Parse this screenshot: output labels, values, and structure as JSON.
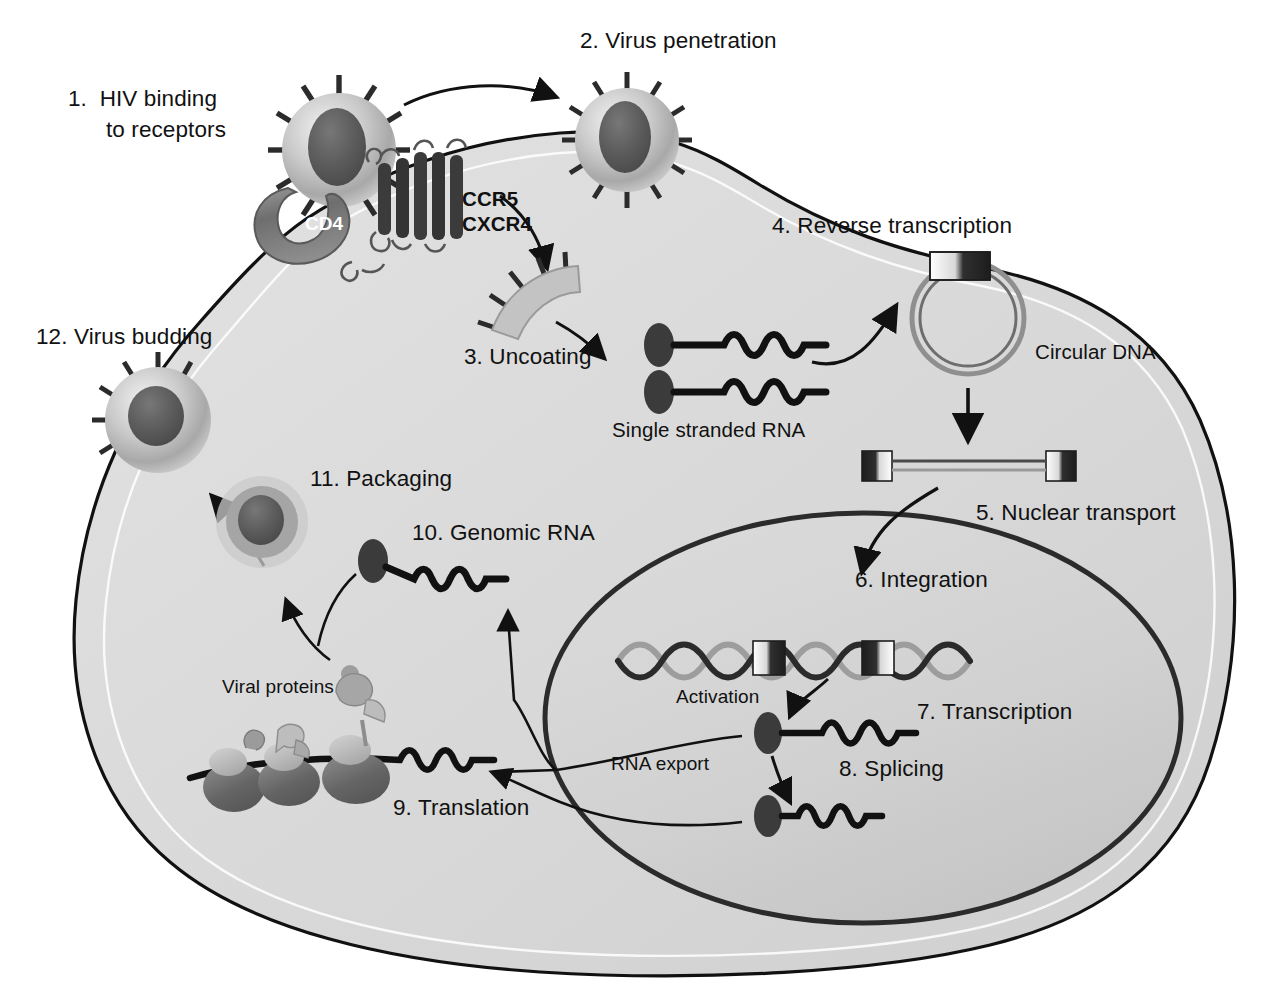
{
  "figure": {
    "type": "biological-process-diagram",
    "background_color": "#ffffff",
    "cytoplasm_color": "#d8d8d8",
    "nucleus_color": "#d0d0d0",
    "outline_color": "#111111",
    "accent_dark": "#3a3a3a",
    "accent_mid": "#8c8c8c",
    "accent_light": "#c6c6c6"
  },
  "steps": [
    {
      "id": 1,
      "label": "1.  HIV binding",
      "label2": "to receptors",
      "x": 68,
      "y": 86
    },
    {
      "id": 2,
      "label": "2. Virus penetration",
      "x": 580,
      "y": 28
    },
    {
      "id": 3,
      "label": "3. Uncoating",
      "x": 464,
      "y": 344
    },
    {
      "id": 4,
      "label": "4. Reverse transcription",
      "x": 772,
      "y": 213
    },
    {
      "id": 5,
      "label": "5. Nuclear transport",
      "x": 976,
      "y": 500
    },
    {
      "id": 6,
      "label": "6. Integration",
      "x": 855,
      "y": 567
    },
    {
      "id": 7,
      "label": "7. Transcription",
      "x": 917,
      "y": 699
    },
    {
      "id": 8,
      "label": "8. Splicing",
      "x": 839,
      "y": 756
    },
    {
      "id": 9,
      "label": "9. Translation",
      "x": 393,
      "y": 795
    },
    {
      "id": 10,
      "label": "10. Genomic RNA",
      "x": 412,
      "y": 520
    },
    {
      "id": 11,
      "label": "11. Packaging",
      "x": 310,
      "y": 466
    },
    {
      "id": 12,
      "label": "12. Virus budding",
      "x": 36,
      "y": 324
    }
  ],
  "annotations": [
    {
      "name": "cd4-label",
      "text": "CD4",
      "x": 305,
      "y": 213
    },
    {
      "name": "ccr5-label",
      "text": "CCR5",
      "x": 462,
      "y": 187
    },
    {
      "name": "cxcr4-label",
      "text": "CXCR4",
      "x": 462,
      "y": 212
    },
    {
      "name": "single-stranded-rna-label",
      "text": "Single stranded RNA",
      "x": 612,
      "y": 418
    },
    {
      "name": "circular-dna-label",
      "text": "Circular DNA",
      "x": 1035,
      "y": 340
    },
    {
      "name": "activation-label",
      "text": "Activation",
      "x": 676,
      "y": 686
    },
    {
      "name": "rna-export-label",
      "text": "RNA export",
      "x": 611,
      "y": 753
    },
    {
      "name": "viral-proteins-label",
      "text": "Viral proteins",
      "x": 222,
      "y": 676
    }
  ],
  "entities": [
    {
      "name": "hiv-virion-binding",
      "kind": "virion",
      "note": "spiked HIV particle outside cell, step 1"
    },
    {
      "name": "hiv-virion-penetrating",
      "kind": "virion",
      "note": "spiked HIV particle entering membrane, step 2"
    },
    {
      "name": "hiv-virion-budding",
      "kind": "virion",
      "note": "spiked HIV particle budding out, step 12"
    },
    {
      "name": "cd4-receptor",
      "kind": "receptor",
      "note": "crescent shaped CD4 molecule"
    },
    {
      "name": "coreceptor-7tm",
      "kind": "receptor",
      "note": "seven transmembrane helix coreceptor CCR5/CXCR4"
    },
    {
      "name": "viral-capsid-opening",
      "kind": "capsid",
      "note": "partially opened spiked envelope fragment, step 3"
    },
    {
      "name": "ssrna-strand-upper",
      "kind": "rna",
      "note": "single stranded RNA with cap"
    },
    {
      "name": "ssrna-strand-lower",
      "kind": "rna",
      "note": "single stranded RNA with cap"
    },
    {
      "name": "circular-dna",
      "kind": "dna",
      "note": "circular viral DNA with LTR block"
    },
    {
      "name": "linear-dna",
      "kind": "dna",
      "note": "linear viral DNA flanked by two LTR blocks"
    },
    {
      "name": "host-chromosome",
      "kind": "dna",
      "note": "host double helix with two integrated proviral LTR blocks"
    },
    {
      "name": "mrna-transcript",
      "kind": "rna",
      "note": "unspliced mRNA, step 7"
    },
    {
      "name": "mrna-spliced",
      "kind": "rna",
      "note": "spliced mRNA, step 8"
    },
    {
      "name": "genomic-rna",
      "kind": "rna",
      "note": "genomic RNA in cytoplasm, step 10"
    },
    {
      "name": "polysome-ribosomes",
      "kind": "ribosome",
      "note": "three ribosomes translating mRNA"
    },
    {
      "name": "nascent-viral-proteins",
      "kind": "protein",
      "note": "folded viral polypeptides on ribosomes"
    },
    {
      "name": "immature-particle",
      "kind": "virion",
      "note": "assembling particle, step 11"
    },
    {
      "name": "cell-membrane",
      "kind": "membrane",
      "note": "outer plasma membrane of the host cell"
    },
    {
      "name": "nuclear-envelope",
      "kind": "membrane",
      "note": "nucleus boundary"
    }
  ]
}
